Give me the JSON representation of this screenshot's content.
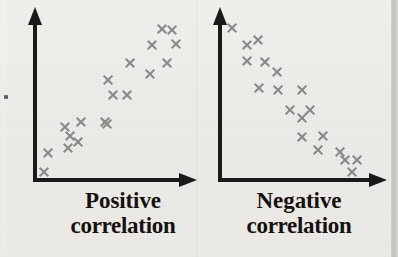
{
  "figure": {
    "background_color": "#f2f0ec",
    "axis_color": "#1a1a1a",
    "marker_color": "#8a8a8a",
    "text_color": "#16110f"
  },
  "panels": [
    {
      "id": "positive",
      "caption_line1": "Positive",
      "caption_line2": "correlation",
      "axis": {
        "origin": [
          35,
          180
        ],
        "y_top": [
          35,
          8
        ],
        "x_right": [
          196,
          180
        ],
        "arrow": "solid-triangle"
      }
    },
    {
      "id": "negative",
      "caption_line1": "Negative",
      "caption_line2": "correlation",
      "axis": {
        "origin": [
          220,
          180
        ],
        "y_top": [
          220,
          8
        ],
        "x_right": [
          386,
          180
        ],
        "arrow": "solid-triangle"
      }
    }
  ],
  "chart_data": [
    {
      "type": "scatter",
      "id": "positive-correlation",
      "title": "Positive correlation",
      "xlabel": "",
      "ylabel": "",
      "xlim": [
        0,
        100
      ],
      "ylim": [
        0,
        100
      ],
      "grid": false,
      "legend": "none",
      "marker": "x",
      "marker_color": "#8a8a8a",
      "series": [
        {
          "name": "observations",
          "x": [
            6,
            9,
            20,
            22,
            26,
            29,
            31,
            38,
            44,
            46,
            50,
            57,
            59,
            62,
            68,
            72,
            78,
            82,
            87
          ],
          "y": [
            5,
            17,
            23,
            28,
            31,
            34,
            40,
            45,
            48,
            55,
            51,
            62,
            65,
            68,
            72,
            78,
            80,
            88,
            92
          ]
        }
      ],
      "pixel_points": [
        [
          44,
          172
        ],
        [
          48,
          153
        ],
        [
          68,
          148
        ],
        [
          70,
          136
        ],
        [
          78,
          142
        ],
        [
          65,
          127
        ],
        [
          81,
          122
        ],
        [
          105,
          122
        ],
        [
          107,
          124
        ],
        [
          113,
          95
        ],
        [
          127,
          95
        ],
        [
          108,
          80
        ],
        [
          130,
          63
        ],
        [
          150,
          74
        ],
        [
          167,
          63
        ],
        [
          152,
          45
        ],
        [
          176,
          44
        ],
        [
          162,
          29
        ],
        [
          172,
          30
        ]
      ]
    },
    {
      "type": "scatter",
      "id": "negative-correlation",
      "title": "Negative correlation",
      "xlabel": "",
      "ylabel": "",
      "xlim": [
        0,
        100
      ],
      "ylim": [
        0,
        100
      ],
      "grid": false,
      "legend": "none",
      "marker": "x",
      "marker_color": "#8a8a8a",
      "series": [
        {
          "name": "observations",
          "x": [
            7,
            16,
            23,
            16,
            27,
            34,
            24,
            35,
            50,
            42,
            54,
            49,
            49,
            62,
            59,
            72,
            74,
            82,
            79
          ],
          "y": [
            92,
            80,
            84,
            72,
            72,
            65,
            56,
            56,
            56,
            47,
            45,
            38,
            32,
            33,
            25,
            23,
            16,
            14,
            7
          ]
        }
      ],
      "pixel_points": [
        [
          232,
          28
        ],
        [
          247,
          45
        ],
        [
          258,
          40
        ],
        [
          247,
          61
        ],
        [
          265,
          62
        ],
        [
          277,
          72
        ],
        [
          259,
          88
        ],
        [
          278,
          90
        ],
        [
          302,
          90
        ],
        [
          290,
          110
        ],
        [
          310,
          110
        ],
        [
          302,
          118
        ],
        [
          302,
          137
        ],
        [
          323,
          136
        ],
        [
          318,
          150
        ],
        [
          340,
          152
        ],
        [
          345,
          160
        ],
        [
          357,
          160
        ],
        [
          352,
          172
        ]
      ]
    }
  ]
}
